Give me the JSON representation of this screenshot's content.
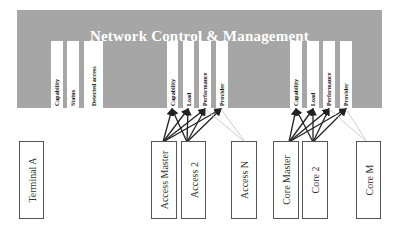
{
  "banner": {
    "title": "Network Control & Management",
    "color": "#a6a6a6",
    "groups": [
      {
        "name": "terminal-attributes",
        "columns": [
          "Capability",
          "Status",
          "Detected access"
        ]
      },
      {
        "name": "access-attributes",
        "columns": [
          "Capability",
          "Load",
          "Performance",
          "Provider"
        ]
      },
      {
        "name": "core-attributes",
        "columns": [
          "Capability",
          "Load",
          "Performance",
          "Provider"
        ]
      }
    ]
  },
  "nodes": {
    "terminal_a": "Terminal A",
    "access_master": "Access Master",
    "access_2": "Access  2",
    "access_n": "Access N",
    "core_master": "Core Master",
    "core_2": "Core 2",
    "core_m": "Core M"
  }
}
